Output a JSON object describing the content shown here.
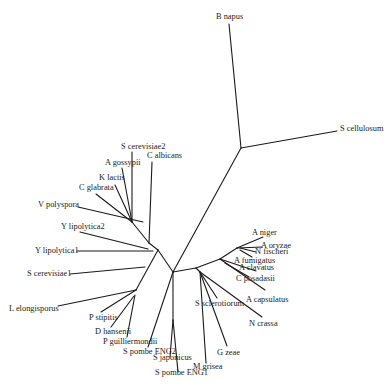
{
  "diagram": {
    "type": "unrooted phylogenetic tree",
    "line_color": "#1a1a1a",
    "text_color": "#222222",
    "background": "#ffffff",
    "taxa": [
      {
        "id": "b_napus",
        "label": "B napus",
        "x": 216,
        "y": 19
      },
      {
        "id": "s_cellulosum",
        "label": "S cellulosum",
        "x": 340,
        "y": 131
      },
      {
        "id": "s_cerevisiae2",
        "label": "S cerevisiae2",
        "x": 121,
        "y": 149
      },
      {
        "id": "c_albicans",
        "label": "C albicans",
        "x": 147,
        "y": 158
      },
      {
        "id": "a_gossypii",
        "label": "A gossypii",
        "x": 105,
        "y": 165
      },
      {
        "id": "k_lactis",
        "label": "K lactis",
        "x": 99,
        "y": 180
      },
      {
        "id": "c_glabrata",
        "label": "C glabrata",
        "x": 79,
        "y": 190
      },
      {
        "id": "v_polyspora",
        "label": "V polyspora",
        "x": 38,
        "y": 207
      },
      {
        "id": "y_lipolytica2",
        "label": "Y lipolytica2",
        "x": 61,
        "y": 229
      },
      {
        "id": "y_lipolytica1",
        "label": "Y lipolytica1",
        "x": 35,
        "y": 253
      },
      {
        "id": "s_cerevisiae1",
        "label": "S cerevisiae1",
        "x": 27,
        "y": 276
      },
      {
        "id": "l_elongisporus",
        "label": "L elongisporus",
        "x": 9,
        "y": 311
      },
      {
        "id": "p_stipitis",
        "label": "P stipitis",
        "x": 89,
        "y": 320
      },
      {
        "id": "d_hansenii",
        "label": "D hansenii",
        "x": 95,
        "y": 334
      },
      {
        "id": "p_guilliermondii",
        "label": "P guilliermondii",
        "x": 103,
        "y": 344
      },
      {
        "id": "s_pombe_eng2",
        "label": "S pombe ENG2",
        "x": 123,
        "y": 354
      },
      {
        "id": "s_japonicus",
        "label": "S japonicus",
        "x": 153,
        "y": 360
      },
      {
        "id": "s_pombe_eng1",
        "label": "S pombe ENG1",
        "x": 155,
        "y": 375
      },
      {
        "id": "m_grisea",
        "label": "M grisea",
        "x": 193,
        "y": 369
      },
      {
        "id": "g_zeae",
        "label": "G zeae",
        "x": 217,
        "y": 355
      },
      {
        "id": "n_crassa",
        "label": "N crassa",
        "x": 249,
        "y": 326
      },
      {
        "id": "s_sclerotiorum",
        "label": "S sclerotiorum",
        "x": 195,
        "y": 306
      },
      {
        "id": "a_capsulatus",
        "label": "A capsulatus",
        "x": 246,
        "y": 302
      },
      {
        "id": "c_posadasii",
        "label": "C posadasii",
        "x": 236,
        "y": 281
      },
      {
        "id": "a_clavatus",
        "label": "A clavatus",
        "x": 239,
        "y": 270
      },
      {
        "id": "a_fumigatus",
        "label": "A fumigatus",
        "x": 234,
        "y": 263
      },
      {
        "id": "n_fischeri",
        "label": "N fischeri",
        "x": 255,
        "y": 254
      },
      {
        "id": "a_oryzae",
        "label": "A oryzae",
        "x": 261,
        "y": 248
      },
      {
        "id": "a_niger",
        "label": "A niger",
        "x": 252,
        "y": 235
      }
    ]
  }
}
